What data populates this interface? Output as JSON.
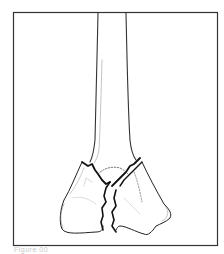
{
  "figure": {
    "frame_color": "#333333",
    "line_color": "#222222",
    "caption": "Figure 00"
  }
}
